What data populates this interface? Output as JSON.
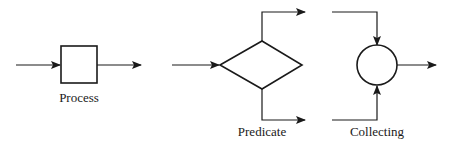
{
  "diagram": {
    "colors": {
      "stroke": "#1a1a1a",
      "background": "#ffffff"
    },
    "nodes": [
      {
        "id": "process",
        "shape": "rectangle",
        "label": "Process",
        "inputs": 1,
        "outputs": 1
      },
      {
        "id": "predicate",
        "shape": "diamond",
        "label": "Predicate",
        "inputs": 1,
        "outputs": 2
      },
      {
        "id": "collecting",
        "shape": "circle",
        "label": "Collecting",
        "inputs": 2,
        "outputs": 1
      }
    ]
  }
}
